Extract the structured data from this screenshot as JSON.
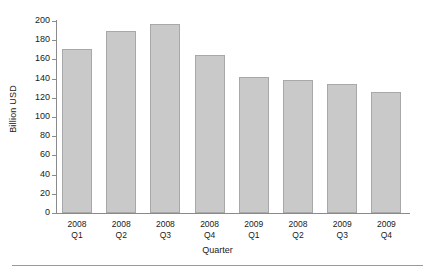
{
  "chart_data": {
    "type": "bar",
    "title": "",
    "subtitle": "",
    "xlabel": "Quarter",
    "ylabel": "Billion USD",
    "categories": [
      "2008 Q1",
      "2008 Q2",
      "2008 Q3",
      "2008 Q4",
      "2009 Q1",
      "2008 Q2",
      "2009 Q3",
      "2009 Q4"
    ],
    "category_lines": [
      {
        "year": "2008",
        "quarter": "Q1"
      },
      {
        "year": "2008",
        "quarter": "Q2"
      },
      {
        "year": "2008",
        "quarter": "Q3"
      },
      {
        "year": "2008",
        "quarter": "Q4"
      },
      {
        "year": "2009",
        "quarter": "Q1"
      },
      {
        "year": "2008",
        "quarter": "Q2"
      },
      {
        "year": "2009",
        "quarter": "Q3"
      },
      {
        "year": "2009",
        "quarter": "Q4"
      }
    ],
    "values": [
      171,
      190,
      197,
      165,
      142,
      139,
      134,
      126
    ],
    "ylim": [
      0,
      200
    ],
    "ytick_values": [
      0,
      20,
      40,
      60,
      80,
      100,
      120,
      140,
      160,
      180,
      200
    ],
    "ytick_labels": [
      "0",
      "20",
      "40",
      "60",
      "80",
      "100",
      "120",
      "140",
      "160",
      "180",
      "200"
    ],
    "grid": false,
    "legend": null,
    "bar_color": "#c9c9c9",
    "bar_border_color": "#a8a8a8",
    "axis_color": "#8a8a8a"
  }
}
